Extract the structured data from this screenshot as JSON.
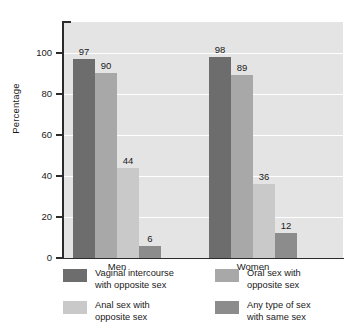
{
  "chart_data": {
    "type": "bar",
    "title": "",
    "xlabel": "",
    "ylabel": "Percentage",
    "ylim": [
      0,
      115
    ],
    "yticks": [
      0,
      20,
      40,
      60,
      80,
      100
    ],
    "ytick_labels": [
      "0",
      "20",
      "40",
      "60",
      "80",
      "100"
    ],
    "grid": true,
    "grid_axis": "y",
    "legend_position": "bottom",
    "categories": [
      "Men",
      "Women"
    ],
    "series": [
      {
        "name": "Vaginal intercourse with opposite sex",
        "name_line1": "Vaginal intercourse",
        "name_line2": "with opposite sex",
        "color": "#6d6d6d",
        "values": [
          97,
          98
        ],
        "value_labels": [
          "97",
          "98"
        ]
      },
      {
        "name": "Oral sex with opposite sex",
        "name_line1": "Oral sex with",
        "name_line2": "opposite sex",
        "color": "#a8a8a8",
        "values": [
          90,
          89
        ],
        "value_labels": [
          "90",
          "89"
        ]
      },
      {
        "name": "Anal sex with opposite sex",
        "name_line1": "Anal sex with",
        "name_line2": "opposite sex",
        "color": "#c9c9c9",
        "values": [
          44,
          36
        ],
        "value_labels": [
          "44",
          "36"
        ]
      },
      {
        "name": "Any type of sex with same sex",
        "name_line1": "Any type of sex",
        "name_line2": "with same sex",
        "color": "#8c8c8c",
        "values": [
          6,
          12
        ],
        "value_labels": [
          "6",
          "12"
        ]
      }
    ],
    "plot_background": "#e4e4e4",
    "gridline_color": "#ffffff",
    "axis_color": "#2b2b2b"
  }
}
